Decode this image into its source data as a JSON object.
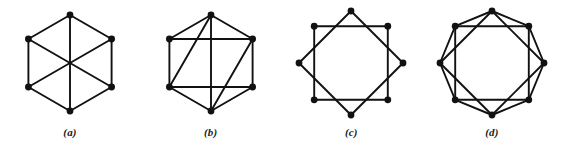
{
  "figure": {
    "background_color": "#ffffff",
    "ink_color": "#111111",
    "edge_width": 1.9,
    "vertex_radius": 3.4,
    "panels": [
      {
        "id": "panel-a",
        "caption": "(a)",
        "vertex_count": 6,
        "edge_count": 9,
        "description": "hexagon-with-three-main-diagonals"
      },
      {
        "id": "panel-b",
        "caption": "(b)",
        "vertex_count": 6,
        "edge_count": 12,
        "description": "hexagon-with-vertical-diagonal-two-horizontal-chords-two-long-diagonals"
      },
      {
        "id": "panel-c",
        "caption": "(c)",
        "vertex_count": 8,
        "edge_count": 8,
        "description": "octagram-two-overlapping-squares-skip-two"
      },
      {
        "id": "panel-d",
        "caption": "(d)",
        "vertex_count": 8,
        "edge_count": 16,
        "description": "circulant-octagon-with-skip-one-chords"
      }
    ]
  },
  "chart_data": {
    "type": "diagram",
    "title": "",
    "subtitle": "",
    "xlabel": "",
    "ylabel": "",
    "legend": [],
    "graphs": [
      {
        "label": "(a)",
        "layout": "regular-hexagon",
        "center": [
          70,
          63
        ],
        "radius": 48,
        "rotation_deg": -90,
        "vertices": [
          {
            "name": "v0",
            "angle_deg": -90,
            "x": 70,
            "y": 15
          },
          {
            "name": "v1",
            "angle_deg": -30,
            "x": 111.6,
            "y": 39
          },
          {
            "name": "v2",
            "angle_deg": 30,
            "x": 111.6,
            "y": 87
          },
          {
            "name": "v3",
            "angle_deg": 90,
            "x": 70,
            "y": 111
          },
          {
            "name": "v4",
            "angle_deg": 150,
            "x": 28.4,
            "y": 87
          },
          {
            "name": "v5",
            "angle_deg": 210,
            "x": 28.4,
            "y": 39
          }
        ],
        "edges": [
          [
            0,
            1
          ],
          [
            1,
            2
          ],
          [
            2,
            3
          ],
          [
            3,
            4
          ],
          [
            4,
            5
          ],
          [
            5,
            0
          ],
          [
            0,
            3
          ],
          [
            1,
            4
          ],
          [
            2,
            5
          ]
        ],
        "degree": 3
      },
      {
        "label": "(b)",
        "layout": "regular-hexagon",
        "center": [
          70,
          63
        ],
        "radius": 48,
        "rotation_deg": -90,
        "vertices": [
          {
            "name": "v0",
            "angle_deg": -90,
            "x": 70,
            "y": 15
          },
          {
            "name": "v1",
            "angle_deg": -30,
            "x": 111.6,
            "y": 39
          },
          {
            "name": "v2",
            "angle_deg": 30,
            "x": 111.6,
            "y": 87
          },
          {
            "name": "v3",
            "angle_deg": 90,
            "x": 70,
            "y": 111
          },
          {
            "name": "v4",
            "angle_deg": 150,
            "x": 28.4,
            "y": 87
          },
          {
            "name": "v5",
            "angle_deg": 210,
            "x": 28.4,
            "y": 39
          }
        ],
        "edges": [
          [
            0,
            1
          ],
          [
            1,
            2
          ],
          [
            2,
            3
          ],
          [
            3,
            4
          ],
          [
            4,
            5
          ],
          [
            5,
            0
          ],
          [
            0,
            3
          ],
          [
            5,
            1
          ],
          [
            4,
            2
          ],
          [
            0,
            4
          ],
          [
            3,
            1
          ]
        ],
        "degree": 4
      },
      {
        "label": "(c)",
        "layout": "regular-octagon",
        "center": [
          70,
          63
        ],
        "radius": 52,
        "rotation_deg": -90,
        "vertices": [
          {
            "name": "v0",
            "angle_deg": -90,
            "x": 70,
            "y": 11
          },
          {
            "name": "v1",
            "angle_deg": -45,
            "x": 106.8,
            "y": 26.2
          },
          {
            "name": "v2",
            "angle_deg": 0,
            "x": 122,
            "y": 63
          },
          {
            "name": "v3",
            "angle_deg": 45,
            "x": 106.8,
            "y": 99.8
          },
          {
            "name": "v4",
            "angle_deg": 90,
            "x": 70,
            "y": 115
          },
          {
            "name": "v5",
            "angle_deg": 135,
            "x": 33.2,
            "y": 99.8
          },
          {
            "name": "v6",
            "angle_deg": 180,
            "x": 18,
            "y": 63
          },
          {
            "name": "v7",
            "angle_deg": 225,
            "x": 33.2,
            "y": 26.2
          }
        ],
        "edges": [
          [
            0,
            2
          ],
          [
            2,
            4
          ],
          [
            4,
            6
          ],
          [
            6,
            0
          ],
          [
            1,
            3
          ],
          [
            3,
            5
          ],
          [
            5,
            7
          ],
          [
            7,
            1
          ]
        ],
        "degree": 2
      },
      {
        "label": "(d)",
        "layout": "regular-octagon",
        "center": [
          70,
          63
        ],
        "radius": 52,
        "rotation_deg": -90,
        "vertices": [
          {
            "name": "v0",
            "angle_deg": -90,
            "x": 70,
            "y": 11
          },
          {
            "name": "v1",
            "angle_deg": -45,
            "x": 106.8,
            "y": 26.2
          },
          {
            "name": "v2",
            "angle_deg": 0,
            "x": 122,
            "y": 63
          },
          {
            "name": "v3",
            "angle_deg": 45,
            "x": 106.8,
            "y": 99.8
          },
          {
            "name": "v4",
            "angle_deg": 90,
            "x": 70,
            "y": 115
          },
          {
            "name": "v5",
            "angle_deg": 135,
            "x": 33.2,
            "y": 99.8
          },
          {
            "name": "v6",
            "angle_deg": 180,
            "x": 18,
            "y": 63
          },
          {
            "name": "v7",
            "angle_deg": 225,
            "x": 33.2,
            "y": 26.2
          }
        ],
        "edges": [
          [
            0,
            1
          ],
          [
            1,
            2
          ],
          [
            2,
            3
          ],
          [
            3,
            4
          ],
          [
            4,
            5
          ],
          [
            5,
            6
          ],
          [
            6,
            7
          ],
          [
            7,
            0
          ],
          [
            0,
            2
          ],
          [
            2,
            4
          ],
          [
            4,
            6
          ],
          [
            6,
            0
          ],
          [
            1,
            3
          ],
          [
            3,
            5
          ],
          [
            5,
            7
          ],
          [
            7,
            1
          ]
        ],
        "degree": 4
      }
    ]
  }
}
